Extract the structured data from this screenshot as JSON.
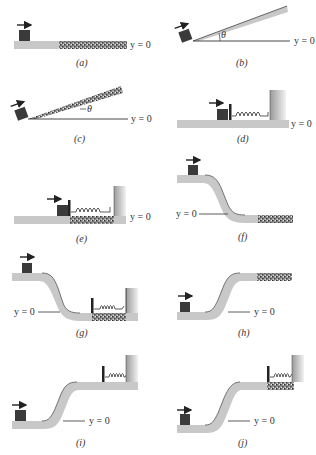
{
  "figure": {
    "y_label": "y = 0",
    "theta_label": "θ",
    "colors": {
      "track": "#c8c8c8",
      "track_edge": "#555555",
      "block": "#3a3a3a",
      "rough": "#6a6a6a",
      "wall": "#bdbdbd",
      "ink": "#222222"
    },
    "panels": [
      {
        "id": "a",
        "caption": "(a)",
        "y_label": "y = 0"
      },
      {
        "id": "b",
        "caption": "(b)",
        "y_label": "y = 0",
        "angle_label": "θ"
      },
      {
        "id": "c",
        "caption": "(c)",
        "y_label": "y = 0",
        "angle_label": "θ"
      },
      {
        "id": "d",
        "caption": "(d)",
        "y_label": "y = 0"
      },
      {
        "id": "e",
        "caption": "(e)",
        "y_label": "y = 0"
      },
      {
        "id": "f",
        "caption": "(f)",
        "y_label": "y = 0"
      },
      {
        "id": "g",
        "caption": "(g)",
        "y_label": "y = 0"
      },
      {
        "id": "h",
        "caption": "(h)",
        "y_label": "y = 0"
      },
      {
        "id": "i",
        "caption": "(i)",
        "y_label": "y = 0"
      },
      {
        "id": "j",
        "caption": "(j)",
        "y_label": "y = 0"
      }
    ]
  }
}
